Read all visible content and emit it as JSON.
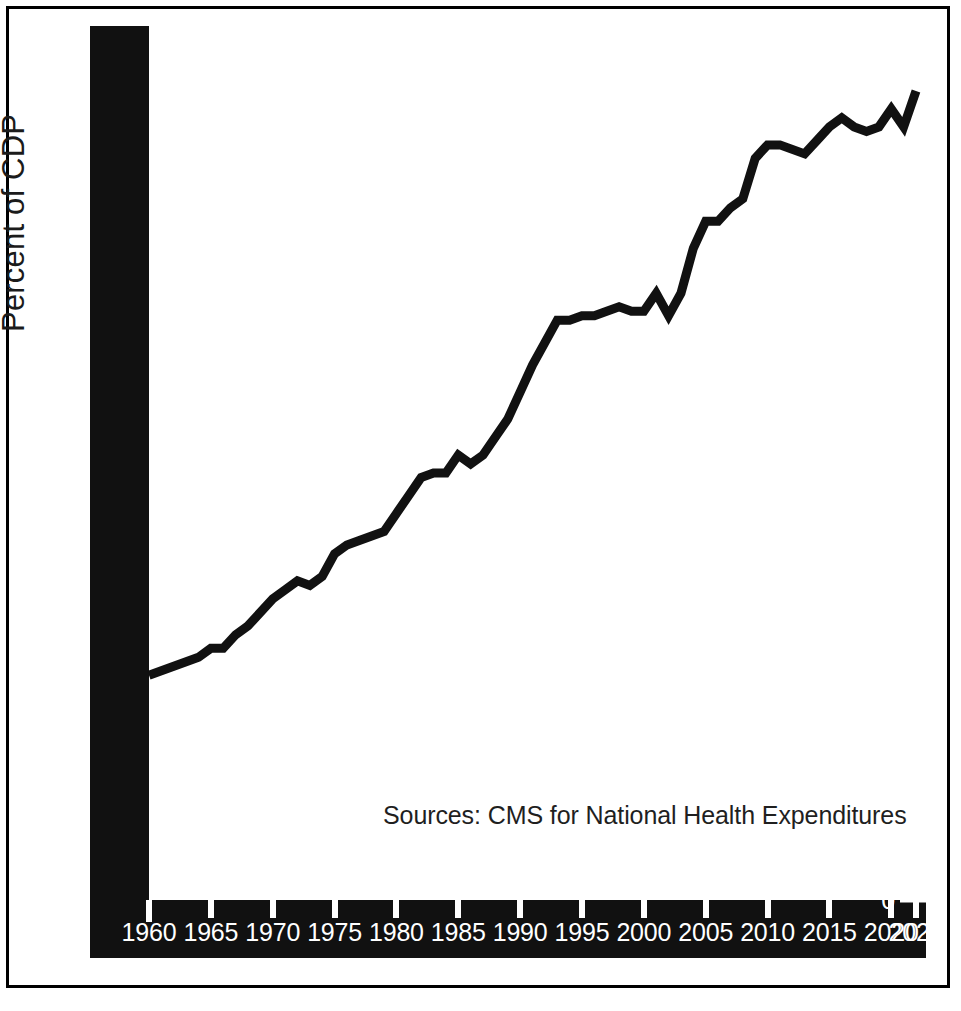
{
  "figure": {
    "background_color": "#ffffff",
    "frame_color": "#000000",
    "axis_band_color": "#111111",
    "axis_text_color": "#ffffff",
    "series_color": "#111111"
  },
  "axis_titles": {
    "y": "Percent of CDP"
  },
  "annotations": {
    "source": "Sources: CMS for National Health Expenditures"
  },
  "chart_data": {
    "type": "line",
    "title": "",
    "subtitle": "",
    "xlabel": "",
    "ylabel": "Percent of CDP",
    "xlim": [
      1960,
      2022
    ],
    "ylim": [
      0,
      19
    ],
    "grid": false,
    "legend": null,
    "annotations": [
      "Sources: CMS for National Health Expenditures"
    ],
    "y_ticks": [
      0,
      1,
      2,
      3,
      4,
      5,
      6,
      7,
      8,
      9,
      10,
      11,
      12,
      13,
      14,
      15,
      16,
      17,
      18,
      19
    ],
    "y_tick_labels": [
      "0",
      "1",
      "2",
      "3",
      "4",
      "5",
      "6",
      "7",
      "8",
      "9",
      "10",
      "11",
      "12",
      "13",
      "14",
      "15",
      "16",
      "17",
      "18",
      "19"
    ],
    "x_ticks": [
      1960,
      1965,
      1970,
      1975,
      1980,
      1985,
      1990,
      1995,
      2000,
      2005,
      2010,
      2015,
      2020,
      2022
    ],
    "x_tick_labels": [
      "1960",
      "1965",
      "1970",
      "1975",
      "1980",
      "1985",
      "1990",
      "1995",
      "2000",
      "2005",
      "2010",
      "2015",
      "2020",
      "2022"
    ],
    "series": [
      {
        "name": "National Health Expenditures as Percent of GDP",
        "color": "#111111",
        "line_width": 9,
        "x": [
          1960,
          1961,
          1962,
          1963,
          1964,
          1965,
          1966,
          1967,
          1968,
          1969,
          1970,
          1971,
          1972,
          1973,
          1974,
          1975,
          1976,
          1977,
          1978,
          1979,
          1980,
          1981,
          1982,
          1983,
          1984,
          1985,
          1986,
          1987,
          1988,
          1989,
          1990,
          1991,
          1992,
          1993,
          1994,
          1995,
          1996,
          1997,
          1998,
          1999,
          2000,
          2001,
          2002,
          2003,
          2004,
          2005,
          2006,
          2007,
          2008,
          2009,
          2010,
          2011,
          2012,
          2013,
          2014,
          2015,
          2016,
          2017,
          2018,
          2019,
          2020,
          2021,
          2022
        ],
        "y": [
          5.0,
          5.1,
          5.2,
          5.3,
          5.4,
          5.6,
          5.6,
          5.9,
          6.1,
          6.4,
          6.7,
          6.9,
          7.1,
          7.0,
          7.2,
          7.7,
          7.9,
          8.0,
          8.1,
          8.2,
          8.6,
          9.0,
          9.4,
          9.5,
          9.5,
          9.9,
          9.7,
          9.9,
          10.3,
          10.7,
          11.3,
          11.9,
          12.4,
          12.9,
          12.9,
          13.0,
          13.0,
          13.1,
          13.2,
          13.1,
          13.1,
          13.5,
          13.0,
          13.5,
          14.5,
          15.1,
          15.1,
          15.4,
          15.6,
          16.5,
          16.8,
          16.8,
          16.7,
          16.6,
          16.9,
          17.2,
          17.4,
          17.2,
          17.1,
          17.2,
          17.6,
          17.2,
          18.0
        ]
      }
    ]
  }
}
